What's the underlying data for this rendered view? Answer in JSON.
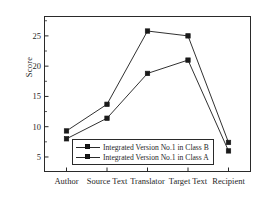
{
  "chart_data": {
    "type": "line",
    "title": "",
    "xlabel": "",
    "ylabel": "Score",
    "categories": [
      "Author",
      "Source Text",
      "Translator",
      "Target Text",
      "Recipient"
    ],
    "series": [
      {
        "name": "Integrated Version No.1 in Class B",
        "values": [
          8.0,
          11.4,
          18.8,
          21.0,
          6.0
        ],
        "color": "#1a1a1a",
        "marker": "square"
      },
      {
        "name": "Integrated Version No.1 in Class A",
        "values": [
          9.3,
          13.7,
          25.8,
          25.0,
          7.4
        ],
        "color": "#1a1a1a",
        "marker": "square"
      }
    ],
    "yticks": [
      5,
      10,
      15,
      20,
      25
    ],
    "ytick_labels": [
      "5",
      "10",
      "15",
      "20",
      "25"
    ],
    "ylim": [
      2.6,
      28.2
    ],
    "grid": false,
    "legend_position": "lower-center-left",
    "legend_border": true,
    "axis_color": "#2a2a2a",
    "background": "#ffffff"
  },
  "legend": {
    "entries": [
      {
        "label": "Integrated Version No.1 in Class B"
      },
      {
        "label": "Integrated Version No.1 in Class A"
      }
    ]
  }
}
